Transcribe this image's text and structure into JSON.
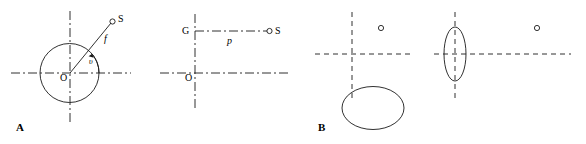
{
  "figure": {
    "title": "",
    "colors": {
      "stroke": "#1a1a1a",
      "background": "#ffffff"
    },
    "panels": [
      {
        "tag": "A",
        "tag_label": "A",
        "subpanels": [
          {
            "name": "circle-cross-section",
            "labels": {
              "origin": "O",
              "source": "S",
              "distance": "f",
              "angle": "υ"
            },
            "shapes": [
              "circle",
              "vertical-axis",
              "horizontal-axis",
              "radial-line",
              "angle-arc",
              "source-marker"
            ]
          },
          {
            "name": "point-source-distance",
            "labels": {
              "origin": "O",
              "gamma": "G",
              "source": "S",
              "distance": "p"
            },
            "shapes": [
              "vertical-axis",
              "horizontal-axis",
              "horizontal-connector",
              "source-marker"
            ]
          }
        ]
      },
      {
        "tag": "B",
        "tag_label": "B",
        "subpanels": [
          {
            "name": "offset-oblate-ellipse",
            "labels": {
              "source": ""
            },
            "shapes": [
              "dashed-vertical-axis",
              "dashed-horizontal-axis",
              "wide-ellipse",
              "source-marker"
            ]
          },
          {
            "name": "centered-prolate-ellipse",
            "labels": {
              "source": ""
            },
            "shapes": [
              "dashed-vertical-axis",
              "dashed-horizontal-axis",
              "tall-ellipse",
              "source-marker"
            ]
          }
        ]
      }
    ]
  }
}
